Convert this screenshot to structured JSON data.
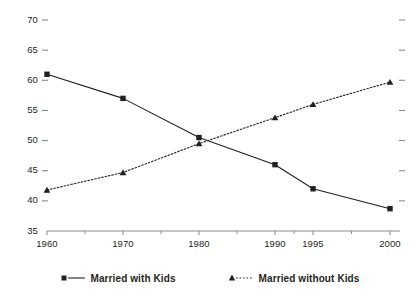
{
  "chart_data": {
    "type": "line",
    "title": "",
    "subtitle": "",
    "xlabel": "",
    "ylabel": "",
    "categories": [
      "1960",
      "1970",
      "1980",
      "1990",
      "1995",
      "2000"
    ],
    "ylim": [
      35,
      70
    ],
    "yticks": [
      35,
      40,
      45,
      50,
      55,
      60,
      65,
      70
    ],
    "ytick_labels": [
      "35",
      "40",
      "45",
      "50",
      "55",
      "60",
      "65",
      "70"
    ],
    "grid": false,
    "legend_position": "bottom",
    "series": [
      {
        "name": "Married with Kids",
        "marker": "square",
        "linestyle": "solid",
        "color": "#231f20",
        "values": [
          61.0,
          57.0,
          50.5,
          46.0,
          42.0,
          38.7
        ]
      },
      {
        "name": "Married without Kids",
        "marker": "triangle",
        "linestyle": "dotted",
        "color": "#231f20",
        "values": [
          41.8,
          44.7,
          49.5,
          53.8,
          56.0,
          59.7
        ]
      }
    ]
  },
  "axes": {
    "axis_color": "#8c8c8c",
    "tick_color": "#8c8c8c",
    "text_color": "#231f20"
  },
  "legend": {
    "entries": [
      {
        "label": "Married with Kids",
        "marker": "square",
        "linestyle": "solid"
      },
      {
        "label": "Married without Kids",
        "marker": "triangle",
        "linestyle": "dotted"
      }
    ]
  }
}
